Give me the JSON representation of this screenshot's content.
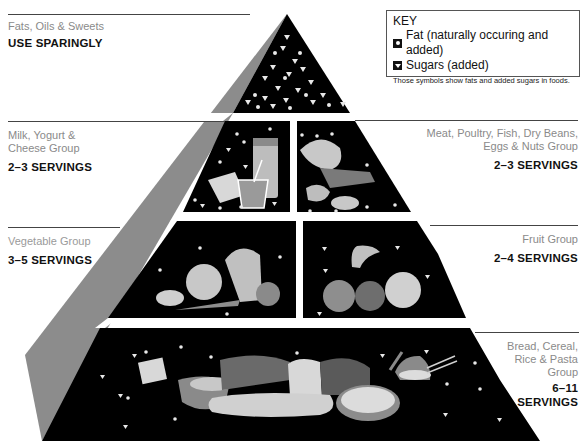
{
  "key": {
    "title": "KEY",
    "items": [
      {
        "symbol": "fat-circle-icon",
        "label": "Fat (naturally occuring and added)"
      },
      {
        "symbol": "sugar-triangle-icon",
        "label": "Sugars (added)"
      }
    ],
    "note": "Those symbols show fats and added sugars in foods."
  },
  "tiers": [
    {
      "group": "Fats, Oils & Sweets",
      "servings": "USE SPARINGLY"
    },
    {
      "group": "Milk, Yogurt & Cheese Group",
      "group_lines": [
        "Milk, Yogurt &",
        "Cheese Group"
      ],
      "servings": "2–3 SERVINGS"
    },
    {
      "group": "Meat, Poultry, Fish, Dry Beans, Eggs & Nuts Group",
      "group_lines": [
        "Meat, Poultry, Fish, Dry Beans,",
        "Eggs & Nuts Group"
      ],
      "servings": "2–3 SERVINGS"
    },
    {
      "group": "Vegetable Group",
      "servings": "3–5 SERVINGS"
    },
    {
      "group": "Fruit Group",
      "servings": "2–4 SERVINGS"
    },
    {
      "group": "Bread, Cereal, Rice & Pasta Group",
      "group_lines": [
        "Bread, Cereal,",
        "Rice & Pasta",
        "Group"
      ],
      "servings_lines": [
        "6–11",
        "SERVINGS"
      ]
    }
  ],
  "colors": {
    "tier_fill": "#000000",
    "side_face": "#8c8c8c",
    "food_gray": "#a8a8a8",
    "symbol": "#e8e8e8"
  }
}
